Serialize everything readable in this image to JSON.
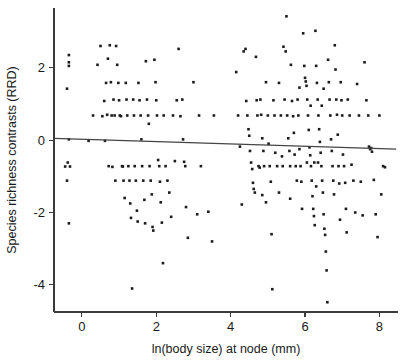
{
  "figure": {
    "background_color": "#ffffff",
    "point_color": "#1c1c1c",
    "axis_color": "#3a3a3a",
    "line_color": "#444444"
  },
  "chart_data": {
    "type": "scatter",
    "title": "",
    "xlabel": "ln(body size) at node (mm)",
    "ylabel": "Species richness contrasts (RRD)",
    "xlim": [
      -0.75,
      8.5
    ],
    "ylim": [
      -4.75,
      3.65
    ],
    "xticks": [
      0,
      2,
      4,
      6,
      8
    ],
    "xticklabels": [
      "0",
      "2",
      "4",
      "6",
      "8"
    ],
    "yticks": [
      2,
      0,
      -2,
      -4
    ],
    "yticklabels": [
      "2",
      "0",
      "-2",
      "-4"
    ],
    "grid": false,
    "legend": null,
    "marker": "square",
    "marker_size": 2.6,
    "series": [
      {
        "name": "regression-fit",
        "type": "line",
        "annotation": "least-squares fit line, slight negative slope",
        "x": [
          -0.75,
          8.45
        ],
        "y": [
          0.05,
          -0.25
        ]
      }
    ],
    "points": [
      [
        -0.35,
        2.35
      ],
      [
        -0.35,
        2.15
      ],
      [
        -0.35,
        2.05
      ],
      [
        -0.4,
        1.42
      ],
      [
        -0.35,
        0.02
      ],
      [
        -0.38,
        -0.62
      ],
      [
        -0.45,
        -0.73
      ],
      [
        -0.32,
        -0.73
      ],
      [
        -0.4,
        -1.12
      ],
      [
        -0.35,
        -2.3
      ],
      [
        0.18,
        -0.02
      ],
      [
        0.3,
        0.68
      ],
      [
        0.42,
        2.08
      ],
      [
        0.5,
        2.6
      ],
      [
        0.55,
        0.66
      ],
      [
        0.6,
        1.08
      ],
      [
        0.62,
        -0.02
      ],
      [
        0.65,
        1.58
      ],
      [
        0.68,
        0.7
      ],
      [
        0.7,
        2.25
      ],
      [
        0.72,
        -0.72
      ],
      [
        0.75,
        2.62
      ],
      [
        0.78,
        1.6
      ],
      [
        0.8,
        0.68
      ],
      [
        0.82,
        -0.74
      ],
      [
        0.85,
        1.12
      ],
      [
        0.88,
        0.68
      ],
      [
        0.9,
        -1.12
      ],
      [
        0.92,
        2.6
      ],
      [
        0.95,
        2.08
      ],
      [
        0.98,
        1.58
      ],
      [
        1.0,
        1.1
      ],
      [
        1.02,
        0.68
      ],
      [
        1.05,
        0.66
      ],
      [
        1.08,
        -0.72
      ],
      [
        1.1,
        -0.73
      ],
      [
        1.12,
        -1.12
      ],
      [
        1.15,
        -1.6
      ],
      [
        1.18,
        1.58
      ],
      [
        1.2,
        1.12
      ],
      [
        1.22,
        0.68
      ],
      [
        1.25,
        -0.72
      ],
      [
        1.28,
        -1.12
      ],
      [
        1.3,
        -1.75
      ],
      [
        1.32,
        -2.15
      ],
      [
        1.35,
        -4.1
      ],
      [
        1.38,
        1.12
      ],
      [
        1.4,
        0.68
      ],
      [
        1.42,
        -0.72
      ],
      [
        1.45,
        -1.12
      ],
      [
        1.48,
        -1.95
      ],
      [
        1.5,
        -2.25
      ],
      [
        1.52,
        1.58
      ],
      [
        1.55,
        1.1
      ],
      [
        1.58,
        0.68
      ],
      [
        1.6,
        0.02
      ],
      [
        1.62,
        -0.72
      ],
      [
        1.65,
        -1.12
      ],
      [
        1.68,
        -1.65
      ],
      [
        1.7,
        -2.3
      ],
      [
        1.72,
        2.18
      ],
      [
        1.75,
        1.12
      ],
      [
        1.78,
        0.68
      ],
      [
        1.8,
        0.45
      ],
      [
        1.82,
        -0.72
      ],
      [
        1.85,
        -1.12
      ],
      [
        1.88,
        -1.5
      ],
      [
        1.9,
        -2.4
      ],
      [
        1.92,
        -2.5
      ],
      [
        1.95,
        2.22
      ],
      [
        1.98,
        1.6
      ],
      [
        2.0,
        1.1
      ],
      [
        2.02,
        0.68
      ],
      [
        2.05,
        -0.55
      ],
      [
        2.08,
        -0.72
      ],
      [
        2.1,
        -1.15
      ],
      [
        2.12,
        -1.72
      ],
      [
        2.15,
        -2.28
      ],
      [
        2.18,
        -3.4
      ],
      [
        2.2,
        0.68
      ],
      [
        2.25,
        -0.72
      ],
      [
        2.3,
        -1.12
      ],
      [
        2.35,
        -1.45
      ],
      [
        2.4,
        -2.12
      ],
      [
        2.45,
        0.68
      ],
      [
        2.5,
        -0.58
      ],
      [
        2.55,
        1.1
      ],
      [
        2.6,
        2.52
      ],
      [
        2.65,
        0.66
      ],
      [
        2.7,
        1.12
      ],
      [
        2.72,
        0.02
      ],
      [
        2.75,
        -0.6
      ],
      [
        2.78,
        -0.72
      ],
      [
        2.8,
        -1.85
      ],
      [
        2.85,
        -2.7
      ],
      [
        3.0,
        1.6
      ],
      [
        3.1,
        -2.05
      ],
      [
        3.15,
        0.68
      ],
      [
        3.2,
        -0.72
      ],
      [
        3.4,
        -1.98
      ],
      [
        3.5,
        -2.8
      ],
      [
        3.55,
        0.68
      ],
      [
        4.15,
        1.88
      ],
      [
        4.2,
        0.68
      ],
      [
        4.25,
        -0.18
      ],
      [
        4.3,
        -1.78
      ],
      [
        4.35,
        2.45
      ],
      [
        4.4,
        2.52
      ],
      [
        4.42,
        1.08
      ],
      [
        4.45,
        0.68
      ],
      [
        4.48,
        0.3
      ],
      [
        4.5,
        0.12
      ],
      [
        4.52,
        -0.3
      ],
      [
        4.55,
        -0.62
      ],
      [
        4.58,
        -0.8
      ],
      [
        4.6,
        -1.18
      ],
      [
        4.62,
        -1.35
      ],
      [
        4.65,
        -1.45
      ],
      [
        4.68,
        2.3
      ],
      [
        4.7,
        1.1
      ],
      [
        4.72,
        0.68
      ],
      [
        4.75,
        -0.72
      ],
      [
        4.78,
        -0.76
      ],
      [
        4.8,
        1.12
      ],
      [
        4.82,
        0.7
      ],
      [
        4.85,
        0.05
      ],
      [
        4.88,
        -0.3
      ],
      [
        4.9,
        -0.72
      ],
      [
        4.95,
        1.6
      ],
      [
        5.0,
        0.68
      ],
      [
        5.02,
        -0.1
      ],
      [
        5.05,
        -0.72
      ],
      [
        5.08,
        -1.15
      ],
      [
        5.1,
        -2.6
      ],
      [
        5.12,
        -4.12
      ],
      [
        5.15,
        1.1
      ],
      [
        5.18,
        0.68
      ],
      [
        5.2,
        -0.35
      ],
      [
        5.25,
        -0.72
      ],
      [
        5.3,
        1.58
      ],
      [
        5.35,
        0.68
      ],
      [
        5.38,
        -0.45
      ],
      [
        5.4,
        -0.72
      ],
      [
        5.45,
        1.12
      ],
      [
        5.5,
        3.42
      ],
      [
        5.52,
        0.68
      ],
      [
        5.55,
        0.05
      ],
      [
        5.58,
        -0.3
      ],
      [
        5.6,
        -0.72
      ],
      [
        5.62,
        2.08
      ],
      [
        5.65,
        1.08
      ],
      [
        5.68,
        0.66
      ],
      [
        5.7,
        0.2
      ],
      [
        5.72,
        -0.4
      ],
      [
        5.75,
        -0.72
      ],
      [
        5.78,
        -1.12
      ],
      [
        5.8,
        1.12
      ],
      [
        5.82,
        0.68
      ],
      [
        5.85,
        -0.25
      ],
      [
        5.88,
        -0.72
      ],
      [
        5.9,
        -1.15
      ],
      [
        5.92,
        -1.9
      ],
      [
        5.95,
        2.95
      ],
      [
        5.98,
        2.05
      ],
      [
        6.0,
        1.72
      ],
      [
        6.02,
        1.62
      ],
      [
        6.04,
        1.5
      ],
      [
        6.06,
        1.12
      ],
      [
        6.08,
        0.68
      ],
      [
        6.1,
        0.28
      ],
      [
        6.12,
        -0.2
      ],
      [
        6.14,
        -0.42
      ],
      [
        6.16,
        -0.72
      ],
      [
        6.18,
        -1.12
      ],
      [
        6.2,
        -1.55
      ],
      [
        6.22,
        -1.9
      ],
      [
        6.24,
        -2.1
      ],
      [
        6.26,
        -2.35
      ],
      [
        6.28,
        3.02
      ],
      [
        6.3,
        2.05
      ],
      [
        6.32,
        1.58
      ],
      [
        6.34,
        1.12
      ],
      [
        6.36,
        0.68
      ],
      [
        6.38,
        0.3
      ],
      [
        6.4,
        -0.05
      ],
      [
        6.42,
        -0.35
      ],
      [
        6.44,
        -0.72
      ],
      [
        6.46,
        -1.12
      ],
      [
        6.48,
        -1.45
      ],
      [
        6.5,
        -2.05
      ],
      [
        6.52,
        -2.45
      ],
      [
        6.54,
        -2.62
      ],
      [
        6.56,
        -3.08
      ],
      [
        6.58,
        -3.6
      ],
      [
        6.6,
        -4.48
      ],
      [
        6.62,
        2.22
      ],
      [
        6.64,
        1.6
      ],
      [
        6.66,
        1.12
      ],
      [
        6.68,
        0.68
      ],
      [
        6.7,
        0.02
      ],
      [
        6.72,
        -0.3
      ],
      [
        6.74,
        -0.72
      ],
      [
        6.76,
        -1.12
      ],
      [
        6.78,
        -1.5
      ],
      [
        6.8,
        2.62
      ],
      [
        6.82,
        1.95
      ],
      [
        6.84,
        1.12
      ],
      [
        6.86,
        0.7
      ],
      [
        6.88,
        0.15
      ],
      [
        6.9,
        -0.72
      ],
      [
        6.92,
        -1.2
      ],
      [
        6.94,
        -2.2
      ],
      [
        6.96,
        1.6
      ],
      [
        6.98,
        1.1
      ],
      [
        7.0,
        0.68
      ],
      [
        7.02,
        -0.4
      ],
      [
        7.05,
        -0.72
      ],
      [
        7.08,
        -1.18
      ],
      [
        7.1,
        -1.9
      ],
      [
        7.12,
        -2.55
      ],
      [
        7.15,
        1.12
      ],
      [
        7.2,
        0.68
      ],
      [
        7.25,
        -0.68
      ],
      [
        7.3,
        -1.12
      ],
      [
        7.35,
        -2.0
      ],
      [
        7.4,
        1.55
      ],
      [
        7.45,
        0.68
      ],
      [
        7.5,
        -1.15
      ],
      [
        7.55,
        -2.08
      ],
      [
        7.6,
        2.15
      ],
      [
        7.65,
        1.1
      ],
      [
        7.7,
        0.68
      ],
      [
        7.75,
        -0.25
      ],
      [
        7.78,
        -0.22
      ],
      [
        7.8,
        -0.32
      ],
      [
        7.85,
        -1.1
      ],
      [
        7.9,
        -2.05
      ],
      [
        7.95,
        -2.68
      ],
      [
        8.0,
        0.68
      ],
      [
        8.05,
        -1.5
      ],
      [
        8.1,
        -0.72
      ],
      [
        8.15,
        -0.75
      ],
      [
        5.42,
        2.58
      ],
      [
        5.48,
        2.45
      ],
      [
        4.95,
        -1.72
      ],
      [
        5.6,
        -1.62
      ],
      [
        6.05,
        -0.62
      ],
      [
        6.15,
        0.95
      ],
      [
        6.35,
        -0.62
      ],
      [
        6.45,
        0.95
      ],
      [
        6.25,
        -0.62
      ],
      [
        5.85,
        1.45
      ],
      [
        6.3,
        -1.28
      ],
      [
        6.5,
        1.42
      ],
      [
        5.3,
        -1.45
      ],
      [
        4.85,
        -1.52
      ],
      [
        7.72,
        -0.18
      ]
    ]
  }
}
